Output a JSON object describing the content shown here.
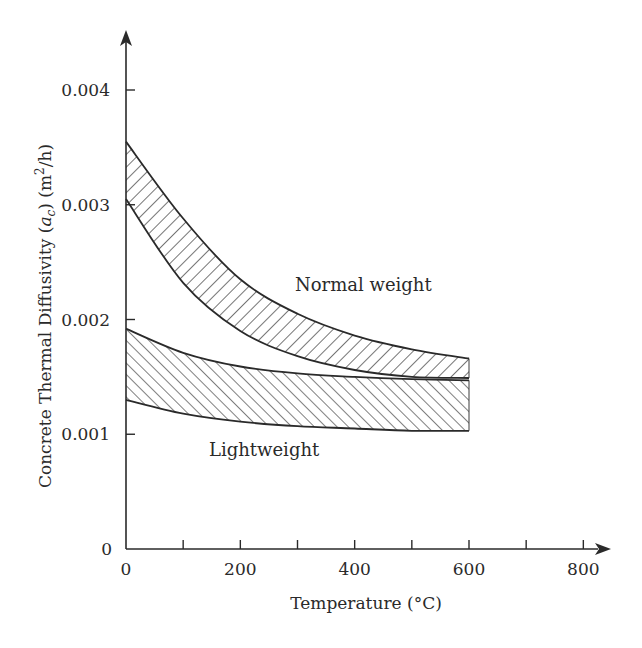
{
  "chart_data": {
    "type": "area",
    "title": "",
    "xlabel": "Temperature (°C)",
    "ylabel_parts": {
      "prefix": "Concrete Thermal Diffusivity (",
      "var": "a",
      "sub": "c",
      "suffix": ") (m",
      "sup": "2",
      "end": "/h)"
    },
    "ylabel": "Concrete Thermal Diffusivity (a_c) (m²/h)",
    "xlim": [
      0,
      850
    ],
    "ylim": [
      0,
      0.0045
    ],
    "x_ticks": [
      0,
      100,
      200,
      300,
      400,
      500,
      600,
      700,
      800
    ],
    "x_tick_labels": [
      "0",
      "200",
      "400",
      "600",
      "800"
    ],
    "x_tick_label_values": [
      0,
      200,
      400,
      600,
      800
    ],
    "y_ticks": [
      0,
      0.001,
      0.002,
      0.003,
      0.004
    ],
    "y_tick_labels": [
      "0",
      "0.001",
      "0.002",
      "0.003",
      "0.004"
    ],
    "grid": false,
    "legend": null,
    "x": [
      0,
      100,
      200,
      300,
      400,
      500,
      600
    ],
    "series": [
      {
        "name": "Normal weight (upper bound)",
        "band": "normal",
        "values": [
          0.00355,
          0.00288,
          0.00235,
          0.00205,
          0.00186,
          0.00174,
          0.00166
        ]
      },
      {
        "name": "Normal weight (lower bound)",
        "band": "normal",
        "values": [
          0.00305,
          0.00232,
          0.0019,
          0.00168,
          0.00156,
          0.0015,
          0.00149
        ]
      },
      {
        "name": "Lightweight (upper bound)",
        "band": "lightweight",
        "values": [
          0.00192,
          0.00171,
          0.00159,
          0.00153,
          0.0015,
          0.00148,
          0.00147
        ]
      },
      {
        "name": "Lightweight (lower bound)",
        "band": "lightweight",
        "values": [
          0.0013,
          0.00118,
          0.00111,
          0.00107,
          0.00105,
          0.00103,
          0.00103
        ]
      }
    ],
    "bands": [
      {
        "name": "Normal weight",
        "label": "Normal weight",
        "hatch": "backslash",
        "label_pos": {
          "x": 295,
          "y": 0.00229
        }
      },
      {
        "name": "Lightweight",
        "label": "Lightweight",
        "hatch": "slash",
        "label_pos": {
          "x": 145,
          "y": 0.00087
        }
      }
    ],
    "annotations": [
      "Normal weight",
      "Lightweight"
    ],
    "colors": {
      "line": "#2a2a2a",
      "hatch": "#3a3a3a",
      "background": "#ffffff"
    }
  },
  "labels": {
    "normal": "Normal weight",
    "light": "Lightweight",
    "xlabel": "Temperature (°C)"
  }
}
